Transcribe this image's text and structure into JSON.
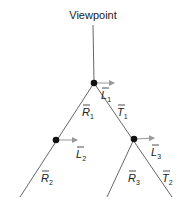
{
  "diagram": {
    "title": "Viewpoint",
    "colors": {
      "line": "#555555",
      "node": "#111111",
      "arrow": "#999999",
      "text": "#222222"
    },
    "nodes": [
      {
        "id": "n1",
        "x": 94,
        "y": 83,
        "light_label": {
          "base": "L",
          "sub": "1",
          "x": 101,
          "y": 99
        }
      },
      {
        "id": "n2",
        "x": 56,
        "y": 140,
        "light_label": {
          "base": "L",
          "sub": "2",
          "x": 76,
          "y": 158
        }
      },
      {
        "id": "n3",
        "x": 134,
        "y": 139,
        "light_label": {
          "base": "L",
          "sub": "3",
          "x": 151,
          "y": 156
        }
      }
    ],
    "edges": [
      {
        "from": "viewpoint",
        "to": "n1",
        "label": null
      },
      {
        "from": "n1",
        "to": "n2",
        "label": {
          "base": "R",
          "sub": "1",
          "x": 82,
          "y": 116
        }
      },
      {
        "from": "n1",
        "to": "n3",
        "label": {
          "base": "T",
          "sub": "1",
          "x": 117,
          "y": 116
        }
      },
      {
        "from": "n2",
        "to": "leaf",
        "label": {
          "base": "R",
          "sub": "2",
          "x": 41,
          "y": 182
        }
      },
      {
        "from": "n3",
        "to": "leaf",
        "label": {
          "base": "R",
          "sub": "3",
          "x": 128,
          "y": 182
        }
      },
      {
        "from": "n3",
        "to": "leaf",
        "label": {
          "base": "T",
          "sub": "2",
          "x": 162,
          "y": 182
        }
      }
    ],
    "labels": {
      "viewpoint": "Viewpoint",
      "L1": "L",
      "L1_sub": "1",
      "L2": "L",
      "L2_sub": "2",
      "L3": "L",
      "L3_sub": "3",
      "R1": "R",
      "R1_sub": "1",
      "T1": "T",
      "T1_sub": "1",
      "R2": "R",
      "R2_sub": "2",
      "R3": "R",
      "R3_sub": "3",
      "T2": "T",
      "T2_sub": "2"
    }
  }
}
